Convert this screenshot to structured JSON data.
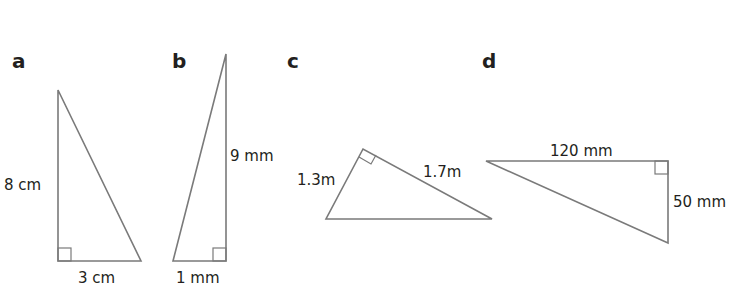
{
  "diagram": {
    "type": "right-triangles-set",
    "triangles": [
      {
        "id": "a",
        "label": "a",
        "sides": {
          "vertical": "8 cm",
          "horizontal": "3 cm"
        }
      },
      {
        "id": "b",
        "label": "b",
        "sides": {
          "vertical": "9 mm",
          "horizontal": "1 mm"
        }
      },
      {
        "id": "c",
        "label": "c",
        "sides": {
          "left_leg": "1.3m",
          "right_leg": "1.7m"
        }
      },
      {
        "id": "d",
        "label": "d",
        "sides": {
          "horizontal": "120 mm",
          "vertical": "50 mm"
        }
      }
    ],
    "colors": {
      "stroke": "#7a7a7a",
      "text": "#231f20",
      "background": "#ffffff"
    }
  }
}
